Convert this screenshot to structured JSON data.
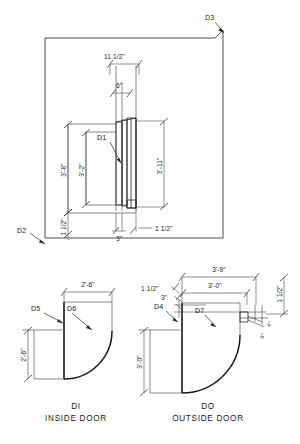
{
  "drawing": {
    "title": "Door elevation and plan details",
    "stroke_color": "#231f20",
    "background_color": "#ffffff"
  },
  "elevation": {
    "name": "door-opening-elevation",
    "tags": {
      "d3": "D3",
      "d2": "D2",
      "d1": "D1"
    },
    "dimensions": {
      "top_overall": "11 1/2\"",
      "top_inner": "6\"",
      "left_outer": "3'-8\"",
      "left_inner": "3'-2\"",
      "right_overall": "3'-11\"",
      "bottom_left": "1 1/2\"",
      "bottom_center": "3\"",
      "bottom_right": "1 1/2\""
    }
  },
  "inside_door": {
    "name": "inside-door-plan",
    "tags": {
      "d5": "D5",
      "d6": "D6"
    },
    "dimensions": {
      "top": "2'-6\"",
      "left": "2'-6\""
    },
    "caption_code": "DI",
    "caption_label": "INSIDE DOOR"
  },
  "outside_door": {
    "name": "outside-door-plan",
    "tags": {
      "d4": "D4",
      "d7": "D7"
    },
    "dimensions": {
      "top_overall": "3'-9\"",
      "top_inner": "3'-0\"",
      "left_upper": "1 1/2\"",
      "left_small": "3\"",
      "right_upper": "1 1/2\"",
      "right_small_a": "4\"",
      "right_small_b": "6\"",
      "left_height": "3'-0\""
    },
    "caption_code": "DO",
    "caption_label": "OUTSIDE DOOR"
  }
}
